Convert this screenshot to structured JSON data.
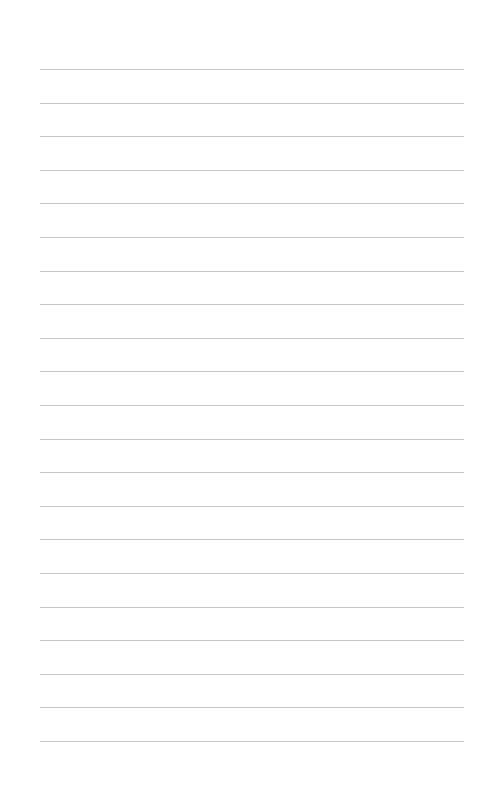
{
  "page": {
    "type": "lined-paper",
    "line_count": 21,
    "first_line_y": 69,
    "line_spacing": 33.6,
    "line_left": 40,
    "line_right": 464,
    "line_color": "#c4c4c4",
    "background_color": "#ffffff"
  }
}
